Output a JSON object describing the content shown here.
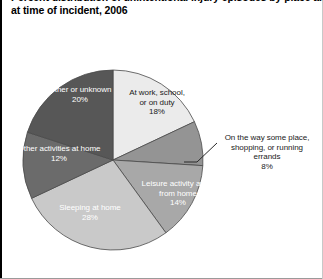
{
  "title": {
    "line1": "Percent distribution of unintentional injury episodes by place and activity",
    "line2": "at time of incident, 2006"
  },
  "chart_data": {
    "type": "pie",
    "title": "Percent distribution of unintentional injury episodes by place and activity at time of incident, 2006",
    "xlabel": "",
    "ylabel": "",
    "legend_position": "none",
    "grid": false,
    "units": "percent",
    "total": 100,
    "start_angle_deg": 0,
    "direction": "clockwise",
    "categories": [
      "At work, school, or on duty",
      "On the way some place, shopping, or running errands",
      "Leisure activity away from home",
      "Sleeping at home",
      "Other activities at home",
      "Other or unknown"
    ],
    "values": [
      18,
      8,
      14,
      28,
      12,
      20
    ],
    "slices": [
      {
        "label": "At work, school, or on duty",
        "label_lines": [
          "At work, school,",
          "or on duty"
        ],
        "value": 18,
        "pct_text": "18%",
        "color": "#ebebeb",
        "label_placement": "inside",
        "label_color": "#1a1a1a"
      },
      {
        "label": "On the way some place, shopping, or running errands",
        "label_lines": [
          "On the way some place,",
          "shopping, or running",
          "errands"
        ],
        "value": 8,
        "pct_text": "8%",
        "color": "#949494",
        "label_placement": "outside",
        "label_color": "#1a1a1a"
      },
      {
        "label": "Leisure activity away from home",
        "label_lines": [
          "Leisure activity away",
          "from home"
        ],
        "value": 14,
        "pct_text": "14%",
        "color": "#a8a8a8",
        "label_placement": "inside",
        "label_color": "#ffffff"
      },
      {
        "label": "Sleeping at home",
        "label_lines": [
          "Sleeping at home"
        ],
        "value": 28,
        "pct_text": "28%",
        "color": "#c9c9c9",
        "label_placement": "inside",
        "label_color": "#ffffff"
      },
      {
        "label": "Other activities at home",
        "label_lines": [
          "Other activities at home"
        ],
        "value": 12,
        "pct_text": "12%",
        "color": "#6b6b6b",
        "label_placement": "inside",
        "label_color": "#ffffff"
      },
      {
        "label": "Other or unknown",
        "label_lines": [
          "Other or unknown"
        ],
        "value": 20,
        "pct_text": "20%",
        "color": "#575757",
        "label_placement": "inside",
        "label_color": "#ffffff"
      }
    ]
  },
  "labels": {
    "at_work_l1": "At work, school,",
    "at_work_l2": "or on duty",
    "at_work_pct": "18%",
    "on_the_way_l1": "On the way some place,",
    "on_the_way_l2": "shopping, or running",
    "on_the_way_l3": "errands",
    "on_the_way_pct": "8%",
    "leisure_l1": "Leisure activity away",
    "leisure_l2": "from home",
    "leisure_pct": "14%",
    "sleeping_l1": "Sleeping at home",
    "sleeping_pct": "28%",
    "other_activities_l1": "Other activities at home",
    "other_activities_pct": "12%",
    "other_unknown_l1": "Other or unknown",
    "other_unknown_pct": "20%"
  }
}
